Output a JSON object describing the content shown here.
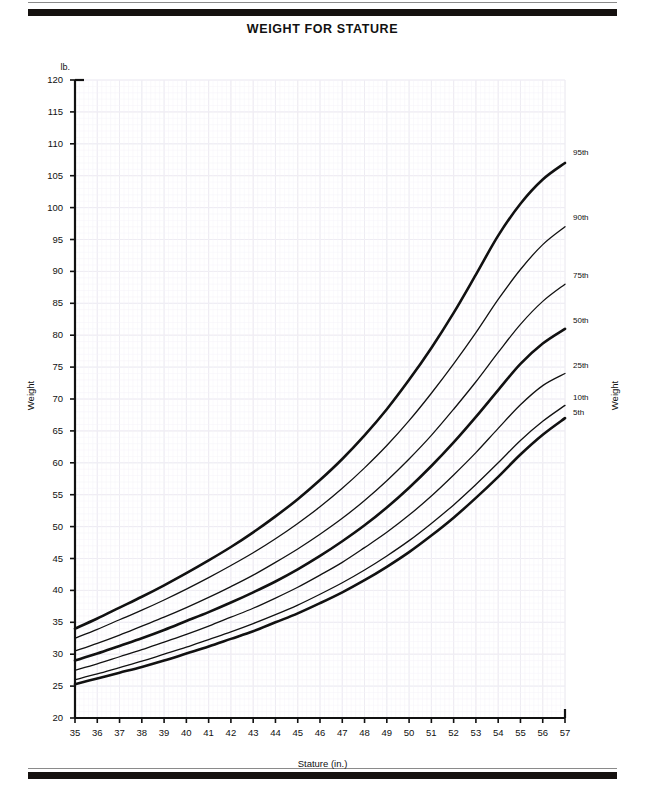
{
  "page_title": "WEIGHT FOR STATURE",
  "axis": {
    "y_unit": "lb.",
    "y_title_left": "Weight",
    "y_title_right": "Weight",
    "x_title": "Stature (in.)"
  },
  "chart_data": {
    "type": "line",
    "title": "WEIGHT FOR STATURE",
    "xlabel": "Stature (in.)",
    "ylabel": "Weight",
    "y_unit": "lb.",
    "xlim": [
      35,
      57
    ],
    "ylim": [
      20,
      120
    ],
    "grid": true,
    "legend_position": "right-inline",
    "x_ticks": [
      35,
      36,
      37,
      38,
      39,
      40,
      41,
      42,
      43,
      44,
      45,
      46,
      47,
      48,
      49,
      50,
      51,
      52,
      53,
      54,
      55,
      56,
      57
    ],
    "y_ticks": [
      20,
      25,
      30,
      35,
      40,
      45,
      50,
      55,
      60,
      65,
      70,
      75,
      80,
      85,
      90,
      95,
      100,
      105,
      110,
      115,
      120
    ],
    "x": [
      35,
      36,
      37,
      38,
      39,
      40,
      41,
      42,
      43,
      44,
      45,
      46,
      47,
      48,
      49,
      50,
      51,
      52,
      53,
      54,
      55,
      56,
      57
    ],
    "series": [
      {
        "name": "95th",
        "label": "95th",
        "emphasis": "heavy",
        "color": "#111111",
        "values": [
          34.0,
          35.6,
          37.3,
          39.0,
          40.8,
          42.7,
          44.7,
          46.8,
          49.1,
          51.6,
          54.3,
          57.3,
          60.6,
          64.3,
          68.4,
          73.0,
          78.0,
          83.5,
          89.5,
          95.6,
          100.6,
          104.4,
          107.0
        ]
      },
      {
        "name": "90th",
        "label": "90th",
        "emphasis": "light",
        "color": "#111111",
        "values": [
          32.5,
          33.9,
          35.4,
          36.9,
          38.5,
          40.2,
          42.0,
          43.9,
          45.9,
          48.1,
          50.5,
          53.1,
          56.0,
          59.2,
          62.7,
          66.6,
          70.9,
          75.5,
          80.4,
          85.6,
          90.3,
          94.2,
          97.0
        ]
      },
      {
        "name": "75th",
        "label": "75th",
        "emphasis": "light",
        "color": "#111111",
        "values": [
          30.5,
          31.7,
          33.0,
          34.4,
          35.8,
          37.3,
          38.9,
          40.6,
          42.4,
          44.4,
          46.5,
          48.8,
          51.3,
          54.1,
          57.2,
          60.6,
          64.3,
          68.4,
          72.7,
          77.3,
          81.7,
          85.3,
          88.0
        ]
      },
      {
        "name": "50th",
        "label": "50th",
        "emphasis": "heavy",
        "color": "#111111",
        "values": [
          29.0,
          30.1,
          31.3,
          32.5,
          33.8,
          35.2,
          36.6,
          38.1,
          39.7,
          41.4,
          43.3,
          45.4,
          47.7,
          50.2,
          53.0,
          56.1,
          59.5,
          63.2,
          67.2,
          71.4,
          75.5,
          78.7,
          81.0
        ]
      },
      {
        "name": "25th",
        "label": "25th",
        "emphasis": "light",
        "color": "#111111",
        "values": [
          27.5,
          28.5,
          29.6,
          30.7,
          31.9,
          33.1,
          34.4,
          35.8,
          37.2,
          38.8,
          40.5,
          42.4,
          44.4,
          46.7,
          49.1,
          51.8,
          54.8,
          58.1,
          61.6,
          65.4,
          69.1,
          72.1,
          74.0
        ]
      },
      {
        "name": "10th",
        "label": "10th",
        "emphasis": "light",
        "color": "#111111",
        "values": [
          26.0,
          26.9,
          27.9,
          28.9,
          30.0,
          31.1,
          32.3,
          33.5,
          34.8,
          36.2,
          37.7,
          39.4,
          41.2,
          43.2,
          45.4,
          47.8,
          50.5,
          53.4,
          56.6,
          60.0,
          63.5,
          66.5,
          69.0
        ]
      },
      {
        "name": "5th",
        "label": "5th",
        "emphasis": "heavy",
        "color": "#111111",
        "values": [
          25.3,
          26.2,
          27.1,
          28.0,
          29.0,
          30.1,
          31.2,
          32.4,
          33.6,
          35.0,
          36.4,
          38.0,
          39.7,
          41.6,
          43.7,
          46.0,
          48.6,
          51.4,
          54.5,
          57.8,
          61.3,
          64.4,
          67.0
        ]
      }
    ]
  },
  "percentile_labels": [
    {
      "text": "95th"
    },
    {
      "text": "90th"
    },
    {
      "text": "75th"
    },
    {
      "text": "50th"
    },
    {
      "text": "25th"
    },
    {
      "text": "10th"
    },
    {
      "text": "5th"
    }
  ],
  "colors": {
    "ink": "#111111",
    "grid": "#e8e6ee",
    "band": "#15110f"
  }
}
